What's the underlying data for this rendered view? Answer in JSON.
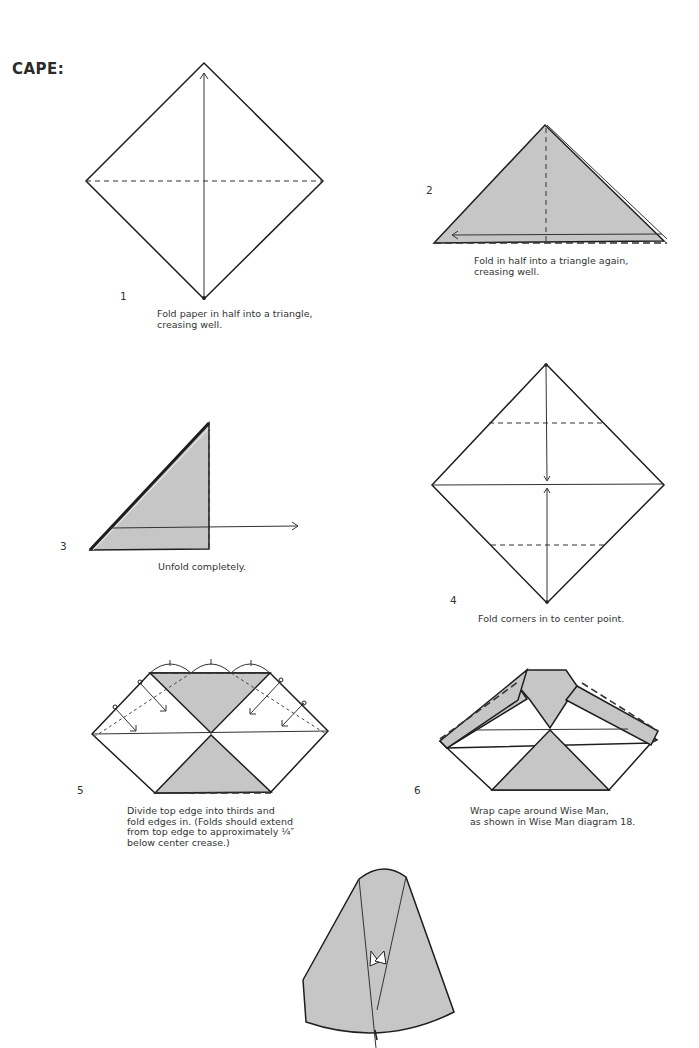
{
  "page": {
    "heading": "CAPE:",
    "colors": {
      "paper_fill": "#c6c6c6",
      "line": "#1e1e1e",
      "background": "#ffffff"
    }
  },
  "steps": [
    {
      "number": "1",
      "caption": "Fold paper in half into a triangle,\ncreasing well."
    },
    {
      "number": "2",
      "caption": "Fold in half into a triangle again,\ncreasing well."
    },
    {
      "number": "3",
      "caption": "Unfold completely."
    },
    {
      "number": "4",
      "caption": "Fold corners in to center point."
    },
    {
      "number": "5",
      "caption": "Divide top edge into thirds and\nfold edges in. (Folds should extend\nfrom top edge to approximately ¼″\nbelow center crease.)"
    },
    {
      "number": "6",
      "caption": "Wrap cape around Wise Man,\nas shown in Wise Man diagram 18."
    }
  ]
}
